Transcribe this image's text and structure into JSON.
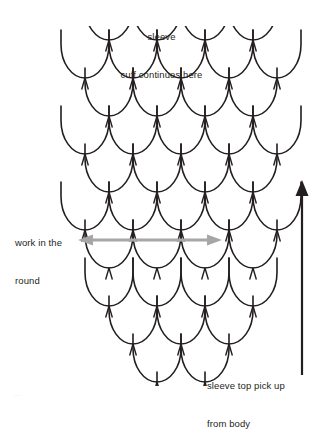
{
  "diagram": {
    "background_color": "#ffffff",
    "scale_stroke_color": "#231f20",
    "arrow_gray_color": "#a6a6a6",
    "arrow_dark_color": "#231f20",
    "labels": {
      "top": {
        "line1": "sleeve",
        "line2": "cuff continues here"
      },
      "left": {
        "line1": "work in the",
        "line2": "round"
      },
      "bottom_right": {
        "line1": "sleeve top pick up",
        "line2": "from body"
      },
      "footer": "..."
    },
    "arrows": {
      "horizontal": {
        "name": "work-in-the-round-width-arrow",
        "direction": "double",
        "color": "#a6a6a6",
        "x1": 78,
        "x2": 222,
        "y": 240
      },
      "vertical": {
        "name": "knitting-direction-arrow",
        "direction": "up",
        "color": "#231f20",
        "x": 302,
        "y_top": 180,
        "y_bottom": 375
      }
    },
    "scale_grid": {
      "scale_width": 48,
      "scale_height": 48,
      "row_step": 38,
      "rows": [
        {
          "index": 0,
          "y": 30,
          "offset": 0,
          "count": 5,
          "start_x": 61,
          "clip_top": true
        },
        {
          "index": 1,
          "y": 68,
          "offset": 24,
          "count": 4,
          "start_x": 85,
          "clip_top": false
        },
        {
          "index": 2,
          "y": 106,
          "offset": 0,
          "count": 5,
          "start_x": 61,
          "clip_top": false
        },
        {
          "index": 3,
          "y": 144,
          "offset": 24,
          "count": 4,
          "start_x": 85,
          "clip_top": false
        },
        {
          "index": 4,
          "y": 182,
          "offset": 0,
          "count": 5,
          "start_x": 61,
          "clip_top": false
        },
        {
          "index": 5,
          "y": 220,
          "offset": 24,
          "count": 4,
          "start_x": 85,
          "clip_top": false
        },
        {
          "index": 6,
          "y": 258,
          "offset": 24,
          "count": 4,
          "start_x": 85,
          "clip_top": false
        },
        {
          "index": 7,
          "y": 296,
          "offset": 48,
          "count": 3,
          "start_x": 109,
          "clip_top": false
        },
        {
          "index": 8,
          "y": 334,
          "offset": 72,
          "count": 2,
          "start_x": 133,
          "clip_top": false
        },
        {
          "index": 9,
          "y": 372,
          "offset": 96,
          "count": 1,
          "start_x": 157,
          "clip_top": false
        }
      ]
    }
  }
}
